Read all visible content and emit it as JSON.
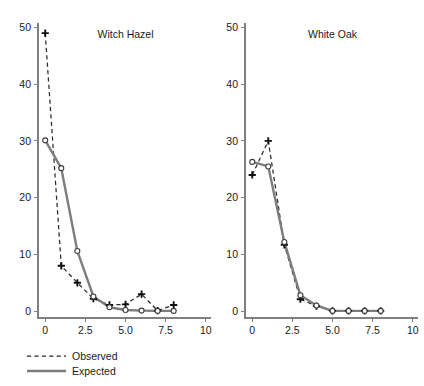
{
  "figure": {
    "background_color": "#ffffff",
    "observed_color": "#2b2b2b",
    "expected_color": "#7d7d7d",
    "axis_color": "#808080"
  },
  "legend": {
    "observed_label": "Observed",
    "expected_label": "Expected"
  },
  "axes": {
    "y_ticks": [
      "0",
      "10",
      "20",
      "30",
      "40",
      "50"
    ],
    "y_tick_values": [
      0,
      10,
      20,
      30,
      40,
      50
    ],
    "x_ticks": [
      "0",
      "2.5",
      "5.0",
      "7.5",
      "10"
    ],
    "x_tick_values": [
      0,
      2.5,
      5,
      7.5,
      10
    ],
    "xlim": [
      -0.45,
      10.2
    ],
    "ylim": [
      -1.2,
      50.6
    ]
  },
  "chart_data": [
    {
      "type": "line",
      "title": "Witch Hazel",
      "xlabel": "",
      "ylabel": "",
      "xlim": [
        -0.45,
        10.2
      ],
      "ylim": [
        -1.2,
        50.6
      ],
      "grid": false,
      "legend_position": "bottom-left",
      "x": [
        0,
        1,
        2,
        3,
        4,
        5,
        6,
        7,
        8
      ],
      "series": [
        {
          "name": "Observed",
          "style": "dashed",
          "marker": "plus",
          "values": [
            49,
            8,
            5,
            2.2,
            1.1,
            1.2,
            3,
            0.1,
            1.1
          ]
        },
        {
          "name": "Expected",
          "style": "solid",
          "marker": "circle",
          "values": [
            30.1,
            25.2,
            10.6,
            2.6,
            0.7,
            0.2,
            0.1,
            0.05,
            0.05
          ]
        }
      ]
    },
    {
      "type": "line",
      "title": "White Oak",
      "xlabel": "",
      "ylabel": "",
      "xlim": [
        -0.45,
        10.2
      ],
      "ylim": [
        -1.2,
        50.6
      ],
      "grid": false,
      "legend_position": "bottom-left",
      "x": [
        0,
        1,
        2,
        3,
        4,
        5,
        6,
        7,
        8
      ],
      "series": [
        {
          "name": "Observed",
          "style": "dashed",
          "marker": "plus",
          "values": [
            24,
            30,
            11.7,
            2.1,
            0.9,
            0.05,
            0.05,
            0.05,
            0.05
          ]
        },
        {
          "name": "Expected",
          "style": "solid",
          "marker": "circle",
          "values": [
            26.3,
            25.5,
            12.2,
            2.8,
            1.0,
            0.05,
            0.05,
            0.05,
            0.05
          ]
        }
      ]
    }
  ]
}
